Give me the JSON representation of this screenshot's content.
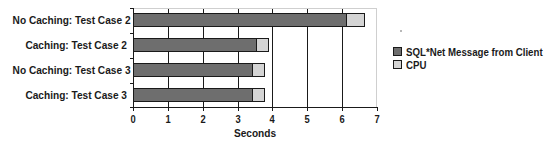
{
  "chart_data": {
    "type": "bar",
    "orientation": "horizontal",
    "stacked": true,
    "title": "",
    "xlabel": "Seconds",
    "ylabel": "",
    "xlim": [
      0,
      7
    ],
    "x_ticks": [
      "0",
      "1",
      "2",
      "3",
      "4",
      "5",
      "6",
      "7"
    ],
    "grid": "vertical",
    "legend_position": "right",
    "categories": [
      "No Caching: Test Case 2",
      "Caching: Test Case 2",
      "No Caching: Test Case 3",
      "Caching: Test Case 3"
    ],
    "series": [
      {
        "name": "SQL*Net Message from Client",
        "color": "#6e6e6e",
        "values": [
          6.13,
          3.55,
          3.44,
          3.44
        ]
      },
      {
        "name": "CPU",
        "color": "#d4d4d4",
        "values": [
          0.52,
          0.35,
          0.34,
          0.34
        ]
      }
    ]
  }
}
